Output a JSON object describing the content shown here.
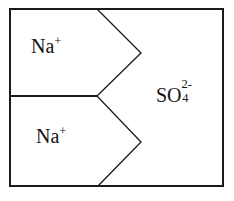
{
  "diagram": {
    "type": "ion-composition-diagram",
    "background_color": "#ffffff",
    "stroke_color": "#1a1a1a",
    "text_color": "#141414",
    "border": {
      "x": 10,
      "y": 9,
      "width": 213,
      "height": 177,
      "stroke_width": 1.6
    },
    "regions": [
      {
        "id": "na-upper",
        "label": "Na",
        "charge": "+",
        "full_text": "Na+",
        "position": "upper-left"
      },
      {
        "id": "na-lower",
        "label": "Na",
        "charge": "+",
        "full_text": "Na+",
        "position": "lower-left"
      },
      {
        "id": "sulfate",
        "label": "SO",
        "subscript": "4",
        "charge": "2-",
        "full_text": "SO4 2-",
        "position": "right"
      }
    ],
    "lines": [
      {
        "id": "upper-chevron",
        "points": "97,9 141,53 97,96",
        "description": "upper arrow pointing right"
      },
      {
        "id": "lower-chevron",
        "points": "97,96 141,142 98,186",
        "description": "lower arrow pointing right"
      },
      {
        "id": "horizontal-divider",
        "points": "10,96 97,96",
        "description": "divider between the two sodium regions"
      }
    ]
  }
}
